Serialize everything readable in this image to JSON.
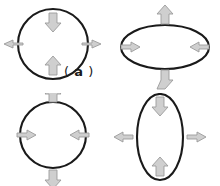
{
  "figure": {
    "background_color": "#ffffff",
    "outline_color": "#1a1a1a",
    "arrow_fill_color": "#cfcfcf",
    "arrow_stroke_color": "#9b9b9b",
    "panel_count": 4
  },
  "panels": [
    {
      "id": "a",
      "label_open_paren": "(",
      "label_letter": "a",
      "label_close_paren": ")",
      "label_text": "( a )",
      "shape": "circle",
      "shape_rx": 35,
      "shape_ry": 35,
      "arrows": [
        {
          "name": "top-arrow",
          "position": "top",
          "direction": "down",
          "sense": "inward"
        },
        {
          "name": "bottom-arrow",
          "position": "bottom",
          "direction": "up",
          "sense": "inward"
        },
        {
          "name": "left-arrow",
          "position": "left",
          "direction": "left",
          "sense": "outward"
        },
        {
          "name": "right-arrow",
          "position": "right",
          "direction": "right",
          "sense": "outward"
        }
      ]
    },
    {
      "id": "b",
      "label_open_paren": "(",
      "label_letter": "b",
      "label_close_paren": ")",
      "label_text": "( b )",
      "shape": "ellipse-horizontal",
      "shape_rx": 44,
      "shape_ry": 22,
      "arrows": [
        {
          "name": "top-arrow",
          "position": "top",
          "direction": "up",
          "sense": "outward"
        },
        {
          "name": "bottom-arrow",
          "position": "bottom",
          "direction": "down",
          "sense": "outward"
        },
        {
          "name": "left-arrow",
          "position": "left",
          "direction": "right",
          "sense": "inward"
        },
        {
          "name": "right-arrow",
          "position": "right",
          "direction": "left",
          "sense": "inward"
        }
      ]
    },
    {
      "id": "c",
      "label_open_paren": "(",
      "label_letter": "c",
      "label_close_paren": ")",
      "label_text": "( c )",
      "shape": "circle",
      "shape_rx": 33,
      "shape_ry": 33,
      "arrows": [
        {
          "name": "top-arrow",
          "position": "top",
          "direction": "up",
          "sense": "outward"
        },
        {
          "name": "bottom-arrow",
          "position": "bottom",
          "direction": "down",
          "sense": "outward"
        },
        {
          "name": "left-arrow",
          "position": "left",
          "direction": "right",
          "sense": "inward"
        },
        {
          "name": "right-arrow",
          "position": "right",
          "direction": "left",
          "sense": "inward"
        }
      ]
    },
    {
      "id": "d",
      "label_open_paren": "(",
      "label_letter": "d",
      "label_close_paren": ")",
      "label_text": "( d )",
      "shape": "ellipse-vertical",
      "shape_rx": 23,
      "shape_ry": 43,
      "arrows": [
        {
          "name": "top-arrow",
          "position": "top",
          "direction": "down",
          "sense": "inward"
        },
        {
          "name": "bottom-arrow",
          "position": "bottom",
          "direction": "up",
          "sense": "inward"
        },
        {
          "name": "left-arrow",
          "position": "left",
          "direction": "left",
          "sense": "outward"
        },
        {
          "name": "right-arrow",
          "position": "right",
          "direction": "right",
          "sense": "outward"
        }
      ]
    }
  ]
}
